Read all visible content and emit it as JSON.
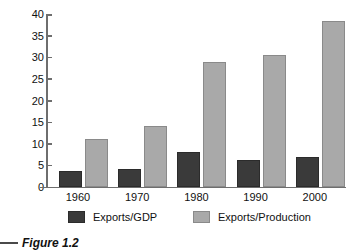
{
  "figure": {
    "caption": "Figure 1.2"
  },
  "legend": {
    "position": "bottom",
    "items": [
      {
        "label": "Exports/GDP",
        "color": "#3a3a3a",
        "swatch": "dark-swatch"
      },
      {
        "label": "Exports/Production",
        "color": "#a9a9a9",
        "swatch": "light-swatch"
      }
    ]
  },
  "chart_data": {
    "type": "bar",
    "title": "",
    "subtitle": "",
    "xlabel": "",
    "ylabel": "",
    "categories": [
      "1960",
      "1970",
      "1980",
      "1990",
      "2000"
    ],
    "series": [
      {
        "name": "Exports/GDP",
        "color": "#3a3a3a",
        "values": [
          3.8,
          4.1,
          8.0,
          6.3,
          7.0
        ]
      },
      {
        "name": "Exports/Production",
        "color": "#a9a9a9",
        "values": [
          11.0,
          14.0,
          29.0,
          30.5,
          38.5
        ]
      }
    ],
    "ylim": [
      0,
      40
    ],
    "yticks": [
      0,
      5,
      10,
      15,
      20,
      25,
      30,
      35,
      40
    ],
    "ytick_labels": [
      "0",
      "5",
      "10",
      "15",
      "20",
      "25",
      "30",
      "35",
      "40"
    ],
    "grid": false,
    "legend_position": "bottom",
    "axis_color": "#6e6e6e",
    "background": "#ffffff"
  }
}
